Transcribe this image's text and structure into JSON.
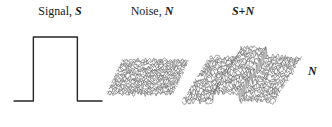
{
  "figure": {
    "width": 332,
    "height": 127,
    "background": "#ffffff",
    "ink": "#1a1a1a"
  },
  "labels": {
    "signal": {
      "text": "Signal, ",
      "symbol": "S",
      "x": 18,
      "y": 4,
      "width": 84
    },
    "noise": {
      "text": "Noise, ",
      "symbol": "N",
      "x": 112,
      "y": 4,
      "width": 80
    },
    "sum": {
      "text": "",
      "symbol": "S+N",
      "x": 208,
      "y": 4,
      "width": 70
    },
    "corner_noise": {
      "symbol": "N",
      "x": 308,
      "y": 65
    }
  },
  "chart_data": [
    {
      "type": "line",
      "name": "signal-pulse",
      "title": "Signal, S",
      "xlabel": "",
      "ylabel": "",
      "grid": false,
      "legend": "none",
      "stroke": "#262626",
      "stroke_width": 1.4,
      "xlim": [
        0,
        100
      ],
      "ylim": [
        0,
        100
      ],
      "x": [
        0,
        22,
        22,
        72,
        72,
        100
      ],
      "y": [
        0,
        0,
        100,
        100,
        0,
        0
      ],
      "description": "Ideal rectangular pulse: flat baseline, sharp rising edge, flat top, sharp falling edge, flat baseline."
    },
    {
      "type": "line",
      "name": "noise-waterfall",
      "title": "Noise, N",
      "xlabel": "",
      "ylabel": "",
      "grid": false,
      "legend": "none",
      "stroke": "#3a3a3a",
      "stroke_width": 0.45,
      "xlim": [
        0,
        100
      ],
      "ylim": [
        -1,
        1
      ],
      "trace_count": 26,
      "samples_per_trace": 120,
      "noise_amplitude": 0.55,
      "signal_amplitude": 0,
      "seed": 1777,
      "description": "Stacked waterfall of pure random noise traces forming a uniform horizontal band of constant thickness; no signal present."
    },
    {
      "type": "line",
      "name": "signal-plus-noise-waterfall",
      "title": "S+N",
      "xlabel": "",
      "ylabel": "",
      "grid": false,
      "legend": "none",
      "stroke": "#3a3a3a",
      "stroke_width": 0.45,
      "xlim": [
        0,
        100
      ],
      "ylim": [
        -1,
        2
      ],
      "trace_count": 30,
      "samples_per_trace": 150,
      "noise_amplitude": 0.55,
      "signal_amplitude": 1.15,
      "signal_start": 0.34,
      "signal_end": 0.62,
      "seed": 4242,
      "description": "Stacked waterfall of noise traces with a rectangular pulse added; the central region rises well above the surrounding noise floor, producing a raised plateau of closely spaced vertical strokes."
    }
  ]
}
